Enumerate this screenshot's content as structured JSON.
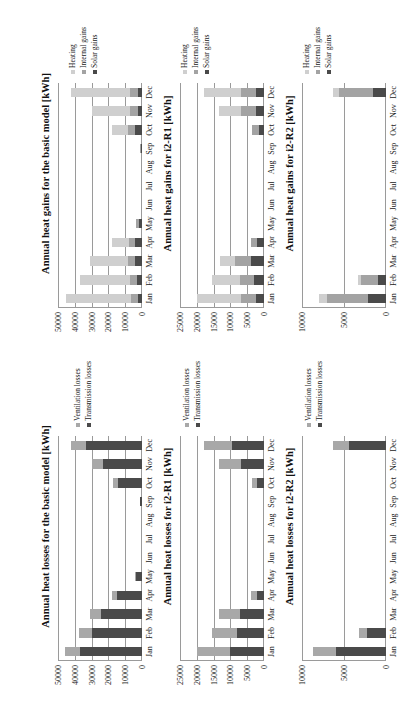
{
  "colors": {
    "heating": "#cfcfcf",
    "internal_gains": "#a3a3a3",
    "solar_gains": "#4a4a4a",
    "ventilation_losses": "#a8a8a8",
    "transmission_losses": "#4a4a4a"
  },
  "months": [
    "Jan",
    "Feb",
    "Mar",
    "Apr",
    "May",
    "Jun",
    "Jul",
    "Aug",
    "Sep",
    "Oct",
    "Nov",
    "Dec"
  ],
  "chart_data": [
    {
      "id": "losses_basic",
      "type": "bar",
      "stacked": true,
      "title": "Annual heat losses for the basic model [kWh]",
      "xlabel": "",
      "ylabel": "",
      "categories": [
        "Jan",
        "Feb",
        "Mar",
        "Apr",
        "May",
        "Jun",
        "Jul",
        "Aug",
        "Sep",
        "Oct",
        "Nov",
        "Dec"
      ],
      "ylim": [
        0,
        50000
      ],
      "yticks": [
        0,
        10000,
        20000,
        30000,
        40000,
        50000
      ],
      "grid": true,
      "legend_position": "right",
      "series": [
        {
          "name": "Transmission losses",
          "color_key": "transmission_losses",
          "values": [
            37000,
            30000,
            24500,
            15000,
            3500,
            0,
            0,
            0,
            1000,
            14000,
            23500,
            33500
          ]
        },
        {
          "name": "Ventilation losses",
          "color_key": "ventilation_losses",
          "values": [
            9000,
            7500,
            6500,
            3000,
            500,
            0,
            0,
            0,
            300,
            3500,
            6000,
            8500
          ]
        }
      ]
    },
    {
      "id": "gains_basic",
      "type": "bar",
      "stacked": true,
      "title": "Annual heat gains for the basic model [kWh]",
      "xlabel": "",
      "ylabel": "",
      "categories": [
        "Jan",
        "Feb",
        "Mar",
        "Apr",
        "May",
        "Jun",
        "Jul",
        "Aug",
        "Sep",
        "Oct",
        "Nov",
        "Dec"
      ],
      "ylim": [
        0,
        50000
      ],
      "yticks": [
        0,
        10000,
        20000,
        30000,
        40000,
        50000
      ],
      "grid": true,
      "legend_position": "right",
      "series": [
        {
          "name": "Solar gains",
          "color_key": "solar_gains",
          "values": [
            2500,
            3000,
            4000,
            4000,
            1500,
            0,
            0,
            0,
            500,
            4000,
            2500,
            2500
          ]
        },
        {
          "name": "Internal gains",
          "color_key": "internal_gains",
          "values": [
            4000,
            4000,
            4500,
            4000,
            2000,
            0,
            0,
            0,
            500,
            4500,
            4500,
            4500
          ]
        },
        {
          "name": "Heating",
          "color_key": "heating",
          "values": [
            39000,
            30000,
            22500,
            10000,
            0,
            0,
            0,
            0,
            0,
            9500,
            22500,
            35000
          ]
        }
      ]
    },
    {
      "id": "losses_i2r1",
      "type": "bar",
      "stacked": true,
      "title": "Annual heat losses for i2-R1 [kWh]",
      "xlabel": "",
      "ylabel": "",
      "categories": [
        "Jan",
        "Feb",
        "Mar",
        "Apr",
        "May",
        "Jun",
        "Jul",
        "Aug",
        "Sep",
        "Oct",
        "Nov",
        "Dec"
      ],
      "ylim": [
        0,
        25000
      ],
      "yticks": [
        0,
        5000,
        10000,
        15000,
        20000,
        25000
      ],
      "grid": true,
      "legend_position": "right",
      "series": [
        {
          "name": "Transmission losses",
          "color_key": "transmission_losses",
          "values": [
            10000,
            8000,
            7000,
            2000,
            0,
            0,
            0,
            0,
            0,
            2000,
            6800,
            9500
          ]
        },
        {
          "name": "Ventilation losses",
          "color_key": "ventilation_losses",
          "values": [
            10000,
            7500,
            6500,
            1800,
            0,
            0,
            0,
            0,
            0,
            1500,
            6500,
            8500
          ]
        }
      ]
    },
    {
      "id": "gains_i2r1",
      "type": "bar",
      "stacked": true,
      "title": "Annual heat gains for i2-R1 [kWh]",
      "xlabel": "",
      "ylabel": "",
      "categories": [
        "Jan",
        "Feb",
        "Mar",
        "Apr",
        "May",
        "Jun",
        "Jul",
        "Aug",
        "Sep",
        "Oct",
        "Nov",
        "Dec"
      ],
      "ylim": [
        0,
        25000
      ],
      "yticks": [
        0,
        5000,
        10000,
        15000,
        20000,
        25000
      ],
      "grid": true,
      "legend_position": "right",
      "series": [
        {
          "name": "Solar gains",
          "color_key": "solar_gains",
          "values": [
            2500,
            3000,
            4000,
            2000,
            0,
            0,
            0,
            0,
            0,
            1500,
            2500,
            2500
          ]
        },
        {
          "name": "Internal gains",
          "color_key": "internal_gains",
          "values": [
            4500,
            4000,
            4500,
            2000,
            0,
            0,
            0,
            0,
            0,
            2000,
            4500,
            4500
          ]
        },
        {
          "name": "Heating",
          "color_key": "heating",
          "values": [
            13000,
            8500,
            4500,
            0,
            0,
            0,
            0,
            0,
            0,
            0,
            6500,
            11000
          ]
        }
      ]
    },
    {
      "id": "losses_i2r2",
      "type": "bar",
      "stacked": true,
      "title": "Annual heat losses for i2-R2 [kWh]",
      "xlabel": "",
      "ylabel": "",
      "categories": [
        "Jan",
        "Feb",
        "Mar",
        "Apr",
        "May",
        "Jun",
        "Jul",
        "Aug",
        "Sep",
        "Oct",
        "Nov",
        "Dec"
      ],
      "ylim": [
        0,
        10000
      ],
      "yticks": [
        0,
        5000,
        10000
      ],
      "grid": true,
      "legend_position": "right",
      "series": [
        {
          "name": "Transmission losses",
          "color_key": "transmission_losses",
          "values": [
            6000,
            2300,
            0,
            0,
            0,
            0,
            0,
            0,
            0,
            0,
            0,
            4400
          ]
        },
        {
          "name": "Ventilation losses",
          "color_key": "ventilation_losses",
          "values": [
            2700,
            900,
            0,
            0,
            0,
            0,
            0,
            0,
            0,
            0,
            0,
            1900
          ]
        }
      ]
    },
    {
      "id": "gains_i2r2",
      "type": "bar",
      "stacked": true,
      "title": "Annual heat gains for i2-R2 [kWh]",
      "xlabel": "",
      "ylabel": "",
      "categories": [
        "Jan",
        "Feb",
        "Mar",
        "Apr",
        "May",
        "Jun",
        "Jul",
        "Aug",
        "Sep",
        "Oct",
        "Nov",
        "Dec"
      ],
      "ylim": [
        0,
        10000
      ],
      "yticks": [
        0,
        5000,
        10000
      ],
      "grid": true,
      "legend_position": "right",
      "series": [
        {
          "name": "Solar gains",
          "color_key": "solar_gains",
          "values": [
            2200,
            1000,
            0,
            0,
            0,
            0,
            0,
            0,
            0,
            0,
            0,
            1500
          ]
        },
        {
          "name": "Internal gains",
          "color_key": "internal_gains",
          "values": [
            4800,
            2000,
            0,
            0,
            0,
            0,
            0,
            0,
            0,
            0,
            0,
            4100
          ]
        },
        {
          "name": "Heating",
          "color_key": "heating",
          "values": [
            1000,
            300,
            0,
            0,
            0,
            0,
            0,
            0,
            0,
            0,
            0,
            700
          ]
        }
      ]
    }
  ]
}
